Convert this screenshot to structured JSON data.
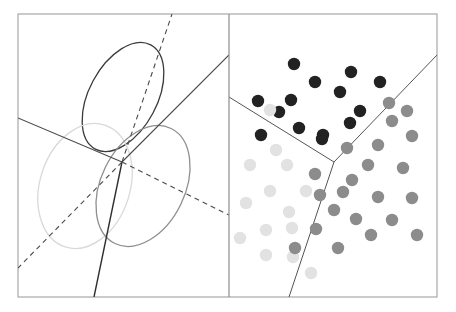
{
  "figure": {
    "title": "",
    "canvas": {
      "width": 456,
      "height": 312,
      "background": "#ffffff"
    },
    "frame": {
      "name": "outer-frame",
      "x": 18,
      "y": 14,
      "width": 419,
      "height": 283,
      "stroke": "#a8a8a8",
      "stroke_width": 1.2,
      "fill": "#ffffff"
    },
    "divider": {
      "name": "panel-divider",
      "x": 229,
      "y1": 14,
      "y2": 297,
      "stroke": "#8c8c8c",
      "stroke_width": 1.2
    },
    "panels": [
      {
        "id": "left",
        "label": "",
        "x": 18,
        "y": 14,
        "width": 211,
        "height": 283
      },
      {
        "id": "right",
        "label": "",
        "x": 229,
        "y": 14,
        "width": 208,
        "height": 283
      }
    ]
  },
  "chart_data": {
    "type": "scatter",
    "title": "",
    "subtitle": "",
    "xlabel": "",
    "ylabel": "",
    "grid": false,
    "legend": "none",
    "panel_count": 2,
    "left_panel": {
      "description": "Three gaussian component confidence ellipses with solid and dashed decision boundary lines",
      "ellipses": [
        {
          "name": "ellipse-dark",
          "cx": 123,
          "cy": 97,
          "rx": 34,
          "ry": 59,
          "rotation_deg": 28,
          "stroke": "#3a3a3a",
          "stroke_width": 1.3,
          "fill": "none"
        },
        {
          "name": "ellipse-light",
          "cx": 85,
          "cy": 186,
          "rx": 45,
          "ry": 64,
          "rotation_deg": 18,
          "stroke": "#d9d9d9",
          "stroke_width": 1.3,
          "fill": "none"
        },
        {
          "name": "ellipse-medium",
          "cx": 143,
          "cy": 186,
          "rx": 42,
          "ry": 64,
          "rotation_deg": 26,
          "stroke": "#8e8e8e",
          "stroke_width": 1.3,
          "fill": "none"
        }
      ],
      "solid_lines": [
        {
          "name": "boundary-solid-nw",
          "x1": 18,
          "y1": 118,
          "x2": 122,
          "y2": 162,
          "stroke": "#4a4a4a",
          "stroke_width": 1.1
        },
        {
          "name": "boundary-solid-ne",
          "x1": 122,
          "y1": 162,
          "x2": 229,
          "y2": 55,
          "stroke": "#4a4a4a",
          "stroke_width": 1.1
        },
        {
          "name": "boundary-solid-s",
          "x1": 122,
          "y1": 162,
          "x2": 94,
          "y2": 297,
          "stroke": "#2e2e2e",
          "stroke_width": 1.4
        }
      ],
      "dashed_lines": [
        {
          "name": "boundary-dashed-n",
          "x1": 122,
          "y1": 162,
          "x2": 172,
          "y2": 14,
          "stroke": "#4a4a4a",
          "stroke_width": 1.1,
          "dash": "5 4"
        },
        {
          "name": "boundary-dashed-sw",
          "x1": 122,
          "y1": 162,
          "x2": 18,
          "y2": 268,
          "stroke": "#4a4a4a",
          "stroke_width": 1.1,
          "dash": "5 4"
        },
        {
          "name": "boundary-dashed-e",
          "x1": 122,
          "y1": 162,
          "x2": 229,
          "y2": 215,
          "stroke": "#4a4a4a",
          "stroke_width": 1.1,
          "dash": "5 4"
        }
      ],
      "intersection_point": {
        "x": 122,
        "y": 162
      }
    },
    "right_panel": {
      "description": "Scatter of classified points in three clusters with piecewise-linear decision boundaries",
      "marker_radius": 6.2,
      "cluster_colors": {
        "dark": "#222222",
        "medium": "#8c8c8c",
        "light": "#e2e2e2"
      },
      "boundaries": [
        {
          "name": "boundary-upper-left",
          "x1": 229,
          "y1": 97,
          "x2": 334,
          "y2": 162,
          "stroke": "#555555",
          "stroke_width": 1.0
        },
        {
          "name": "boundary-upper-right",
          "x1": 334,
          "y1": 162,
          "x2": 437,
          "y2": 55,
          "stroke": "#555555",
          "stroke_width": 1.0
        },
        {
          "name": "boundary-lower",
          "x1": 334,
          "y1": 162,
          "x2": 289,
          "y2": 297,
          "stroke": "#555555",
          "stroke_width": 1.0
        }
      ],
      "points": [
        {
          "x": 294,
          "y": 64,
          "class": "dark"
        },
        {
          "x": 315,
          "y": 82,
          "class": "dark"
        },
        {
          "x": 351,
          "y": 72,
          "class": "dark"
        },
        {
          "x": 380,
          "y": 82,
          "class": "dark"
        },
        {
          "x": 340,
          "y": 92,
          "class": "dark"
        },
        {
          "x": 258,
          "y": 101,
          "class": "dark"
        },
        {
          "x": 291,
          "y": 100,
          "class": "dark"
        },
        {
          "x": 279,
          "y": 112,
          "class": "dark"
        },
        {
          "x": 360,
          "y": 111,
          "class": "dark"
        },
        {
          "x": 389,
          "y": 103,
          "class": "medium"
        },
        {
          "x": 270,
          "y": 110,
          "class": "light"
        },
        {
          "x": 299,
          "y": 128,
          "class": "dark"
        },
        {
          "x": 323,
          "y": 135,
          "class": "dark"
        },
        {
          "x": 350,
          "y": 123,
          "class": "dark"
        },
        {
          "x": 392,
          "y": 121,
          "class": "medium"
        },
        {
          "x": 261,
          "y": 135,
          "class": "dark"
        },
        {
          "x": 322,
          "y": 139,
          "class": "dark"
        },
        {
          "x": 407,
          "y": 111,
          "class": "medium"
        },
        {
          "x": 412,
          "y": 136,
          "class": "medium"
        },
        {
          "x": 378,
          "y": 145,
          "class": "medium"
        },
        {
          "x": 347,
          "y": 148,
          "class": "medium"
        },
        {
          "x": 276,
          "y": 150,
          "class": "light"
        },
        {
          "x": 250,
          "y": 165,
          "class": "light"
        },
        {
          "x": 287,
          "y": 165,
          "class": "light"
        },
        {
          "x": 315,
          "y": 174,
          "class": "medium"
        },
        {
          "x": 320,
          "y": 195,
          "class": "medium"
        },
        {
          "x": 368,
          "y": 165,
          "class": "medium"
        },
        {
          "x": 403,
          "y": 168,
          "class": "medium"
        },
        {
          "x": 270,
          "y": 191,
          "class": "light"
        },
        {
          "x": 306,
          "y": 191,
          "class": "light"
        },
        {
          "x": 246,
          "y": 203,
          "class": "light"
        },
        {
          "x": 289,
          "y": 212,
          "class": "light"
        },
        {
          "x": 343,
          "y": 192,
          "class": "medium"
        },
        {
          "x": 378,
          "y": 197,
          "class": "medium"
        },
        {
          "x": 412,
          "y": 198,
          "class": "medium"
        },
        {
          "x": 266,
          "y": 230,
          "class": "light"
        },
        {
          "x": 292,
          "y": 228,
          "class": "light"
        },
        {
          "x": 240,
          "y": 238,
          "class": "light"
        },
        {
          "x": 316,
          "y": 229,
          "class": "medium"
        },
        {
          "x": 356,
          "y": 219,
          "class": "medium"
        },
        {
          "x": 392,
          "y": 220,
          "class": "medium"
        },
        {
          "x": 417,
          "y": 235,
          "class": "medium"
        },
        {
          "x": 266,
          "y": 255,
          "class": "light"
        },
        {
          "x": 293,
          "y": 257,
          "class": "light"
        },
        {
          "x": 295,
          "y": 248,
          "class": "medium"
        },
        {
          "x": 338,
          "y": 248,
          "class": "medium"
        },
        {
          "x": 371,
          "y": 235,
          "class": "medium"
        },
        {
          "x": 311,
          "y": 273,
          "class": "light"
        },
        {
          "x": 352,
          "y": 180,
          "class": "medium"
        },
        {
          "x": 334,
          "y": 210,
          "class": "medium"
        }
      ]
    }
  }
}
